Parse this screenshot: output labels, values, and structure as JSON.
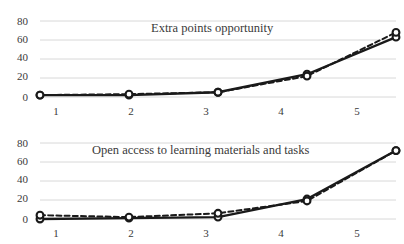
{
  "chart_data": [
    {
      "type": "line",
      "title": "Extra points opportunity",
      "xlabel": "",
      "ylabel": "",
      "x": [
        1,
        2,
        3,
        4,
        5
      ],
      "categories": [
        "1",
        "2",
        "3",
        "4",
        "5"
      ],
      "xtick_labels": [
        "1",
        "2",
        "3",
        "4",
        "5"
      ],
      "ytick_labels": [
        "0",
        "20",
        "40",
        "60",
        "80"
      ],
      "yticks": [
        0,
        20,
        40,
        60,
        80
      ],
      "ylim": [
        0,
        80
      ],
      "xlim": [
        1,
        5
      ],
      "grid": true,
      "legend": "none",
      "series": [
        {
          "name": "solid",
          "style": "solid",
          "marker": "open-circle",
          "values": [
            2,
            2,
            5,
            24,
            63
          ]
        },
        {
          "name": "dashed",
          "style": "dashed",
          "marker": "open-circle",
          "values": [
            2,
            3,
            5,
            22,
            68
          ]
        }
      ]
    },
    {
      "type": "line",
      "title": "Open access to learning materials and tasks",
      "xlabel": "",
      "ylabel": "",
      "x": [
        1,
        2,
        3,
        4,
        5
      ],
      "categories": [
        "1",
        "2",
        "3",
        "4",
        "5"
      ],
      "xtick_labels": [
        "1",
        "2",
        "3",
        "4",
        "5"
      ],
      "ytick_labels": [
        "0",
        "20",
        "40",
        "60",
        "80"
      ],
      "yticks": [
        0,
        20,
        40,
        60,
        80
      ],
      "ylim": [
        0,
        80
      ],
      "xlim": [
        1,
        5
      ],
      "grid": true,
      "legend": "none",
      "series": [
        {
          "name": "solid",
          "style": "solid",
          "marker": "open-circle",
          "values": [
            0,
            1,
            2,
            21,
            72
          ]
        },
        {
          "name": "dashed",
          "style": "dashed",
          "marker": "open-circle",
          "values": [
            4,
            2,
            6,
            19,
            72
          ]
        }
      ]
    }
  ],
  "style": {
    "background": "#ffffff",
    "grid_color": "#d4d4d4",
    "line_color": "#1a1a1a",
    "marker_fill": "#ffffff",
    "text_color": "#3a3a3a"
  },
  "panels": [
    {
      "title": "Extra points opportunity",
      "ytick_labels": [
        "80",
        "60",
        "40",
        "20",
        "0"
      ],
      "xtick_labels": [
        "1",
        "2",
        "3",
        "4",
        "5"
      ]
    },
    {
      "title": "Open access to learning materials and tasks",
      "ytick_labels": [
        "80",
        "60",
        "40",
        "20",
        "0"
      ],
      "xtick_labels": [
        "1",
        "2",
        "3",
        "4",
        "5"
      ]
    }
  ]
}
